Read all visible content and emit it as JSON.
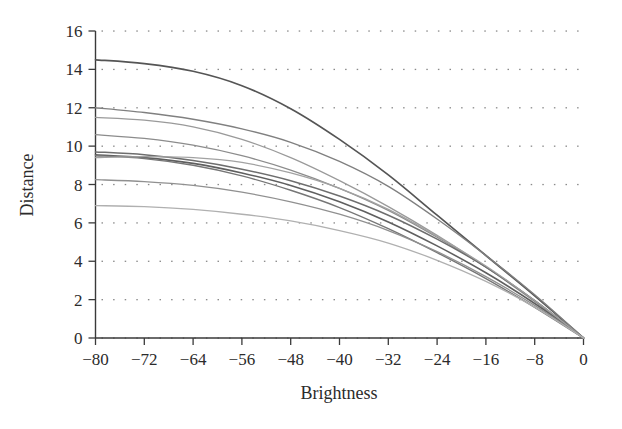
{
  "chart_data": {
    "type": "line",
    "title": "",
    "xlabel": "Brightness",
    "ylabel": "Distance",
    "xlim": [
      -80,
      0
    ],
    "ylim": [
      0,
      16
    ],
    "xticks": [
      -80,
      -72,
      -64,
      -56,
      -48,
      -40,
      -32,
      -24,
      -16,
      -8,
      0
    ],
    "yticks": [
      0,
      2,
      4,
      6,
      8,
      10,
      12,
      14,
      16
    ],
    "xticklabels": [
      "−80",
      "−72",
      "−64",
      "−56",
      "−48",
      "−40",
      "−32",
      "−24",
      "−16",
      "−8",
      "0"
    ],
    "yticklabels": [
      "0",
      "2",
      "4",
      "6",
      "8",
      "10",
      "12",
      "14",
      "16"
    ],
    "grid": "dotted-horizontal",
    "legend": "none",
    "x": [
      -80,
      -72,
      -64,
      -56,
      -48,
      -40,
      -32,
      -24,
      -16,
      -8,
      0
    ],
    "series": [
      {
        "name": "curve-1",
        "color": "#555555",
        "width": 1.7,
        "values": [
          14.5,
          14.3,
          13.9,
          13.15,
          11.95,
          10.35,
          8.5,
          6.4,
          4.3,
          2.2,
          0.0
        ]
      },
      {
        "name": "curve-2",
        "color": "#808080",
        "width": 1.4,
        "values": [
          12.0,
          11.75,
          11.4,
          10.9,
          10.2,
          9.2,
          7.9,
          6.2,
          4.3,
          2.25,
          0.0
        ]
      },
      {
        "name": "curve-3",
        "color": "#9a9a9a",
        "width": 1.3,
        "values": [
          11.5,
          11.35,
          11.0,
          10.35,
          9.4,
          8.2,
          6.85,
          5.35,
          3.7,
          1.9,
          0.0
        ]
      },
      {
        "name": "curve-4",
        "color": "#8c8c8c",
        "width": 1.3,
        "values": [
          10.6,
          10.4,
          10.05,
          9.5,
          8.75,
          7.8,
          6.65,
          5.25,
          3.7,
          1.95,
          0.0
        ]
      },
      {
        "name": "curve-5",
        "color": "#6e6e6e",
        "width": 1.5,
        "values": [
          9.7,
          9.55,
          9.25,
          8.8,
          8.2,
          7.4,
          6.4,
          5.15,
          3.7,
          1.95,
          0.0
        ]
      },
      {
        "name": "curve-6",
        "color": "#5f5f5f",
        "width": 1.6,
        "values": [
          9.55,
          9.4,
          9.1,
          8.6,
          7.95,
          7.1,
          6.05,
          4.8,
          3.4,
          1.8,
          0.0
        ]
      },
      {
        "name": "curve-7",
        "color": "#767676",
        "width": 1.4,
        "values": [
          9.5,
          9.35,
          9.0,
          8.45,
          7.7,
          6.8,
          5.7,
          4.45,
          3.1,
          1.6,
          0.0
        ]
      },
      {
        "name": "curve-8",
        "color": "#a2a2a2",
        "width": 1.3,
        "values": [
          9.4,
          9.45,
          9.4,
          9.15,
          8.6,
          7.8,
          6.7,
          5.3,
          3.75,
          1.95,
          0.0
        ]
      },
      {
        "name": "curve-9",
        "color": "#909090",
        "width": 1.3,
        "values": [
          8.25,
          8.15,
          7.95,
          7.6,
          7.1,
          6.45,
          5.6,
          4.5,
          3.2,
          1.7,
          0.0
        ]
      },
      {
        "name": "curve-10",
        "color": "#b0b0b0",
        "width": 1.3,
        "values": [
          6.9,
          6.85,
          6.7,
          6.45,
          6.1,
          5.6,
          4.95,
          4.05,
          2.95,
          1.6,
          0.0
        ]
      }
    ]
  },
  "figure": {
    "background": "#ffffff",
    "axis_color": "#3a3a3a",
    "grid_dot_color": "#8a8a8a"
  }
}
